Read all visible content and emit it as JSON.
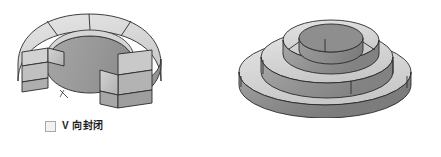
{
  "figures": {
    "open": {
      "caption_label": "V 向封闭",
      "checkbox_checked": false,
      "checkbox_state_glyph": "",
      "shape_name": "open C-shaped stepped ring",
      "focus_outline": false
    },
    "closed": {
      "caption_label": "V 向封闭",
      "checkbox_checked": true,
      "checkbox_state_glyph": "✓",
      "shape_name": "closed stepped ring",
      "focus_outline": true
    }
  },
  "colors": {
    "background": "#ffffff",
    "top_face_light": "#dcdcdc",
    "top_face_mid": "#cfcfcf",
    "inner_wall": "#9d9d9d",
    "outer_wall": "#8f8f8f",
    "outer_wall_dark": "#7f7f7f",
    "end_cap": "#c4c4c4",
    "outline": "#2a2a2a",
    "checkbox_border": "#a9a9a9",
    "checkbox_fill": "#f2f2f2",
    "label_text": "#1d1d1d"
  }
}
